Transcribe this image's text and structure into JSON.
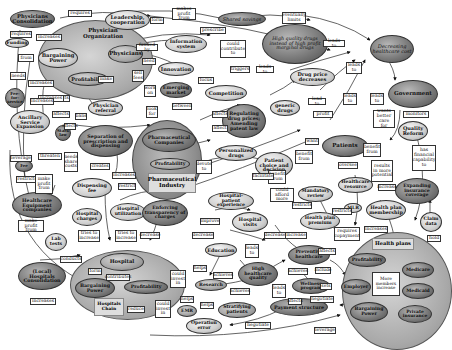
{
  "diagram": {
    "nodes": {
      "physicians_consolidation": "Physicians Consolidation",
      "leadership_cooperation": "Leadership, cooperation",
      "physician_organization": "Physician Organization",
      "bargaining_power_phys": "Bargaining Power",
      "physicians": "Physicians",
      "profitability_phys": "Profitability",
      "funding": "Funding",
      "fee_for_service": "Fee-for-service",
      "physician_referral": "Physician referral",
      "ancillary_service_expansion": "Ancillary Service Expansion",
      "stark_law": "Stark law",
      "shared_savings": "Shared savings",
      "information_system": "Information system",
      "innovation": "Innovation",
      "emerging_market": "Emerging market",
      "competition": "Competition",
      "high_quality_drugs": "High quality drugs instead of high profit marginal drugs",
      "decreasing_healthcare_cost": "Decreasing healthcare cost",
      "drug_price_decreases": "Drug price decreases",
      "generic_drugs": "generic drugs",
      "regulating_drug_prices": "Regulating drug prices; Amending patent law",
      "government": "Government",
      "quality_reform": "Quality Reform",
      "separation_prescription_dispensing": "Separation of prescription and dispensing",
      "pharmaceutical_companies": "Pharmaceutical Companies",
      "profitability_pharma": "Profitability",
      "pharmaceutical_industry": "Pharmaceutical Industry",
      "personalized_drugs": "Personalized drugs",
      "patient_choice": "Patient choice and decision",
      "patients": "Patients",
      "dispensing_fee": "Dispensing fee",
      "fee_icon": "Fee",
      "healthcare_equipment_companies": "Healthcare Equipment companies",
      "hospital_charges": "Hospital charges",
      "hospital_utilization": "Hospital utilization",
      "enforcing_transparency": "Enforcing transparency of charges",
      "hospital_patient_experience": "Hospital-patient experience",
      "hospital_visits": "Hospital visits",
      "mandatory_review": "Mandatory review",
      "healthcare_resource": "Healthcare resource",
      "mlr": "MLR",
      "health_plan_premium": "Health plan premium",
      "health_plan_membership": "Health plan membership",
      "expanding_insurance_coverage": "Expanding insurance coverage",
      "claim_data": "Claim data",
      "lab_tests": "Lab tests",
      "local_hospitals_consolidation": "(Local) Hospitals Consolidation",
      "hospital": "Hospital",
      "bargaining_power_hosp": "Bargaining Power",
      "profitability_hosp": "Profitability",
      "hospitals_chain": "Hospitals Chain",
      "education": "Education",
      "research": "Research",
      "emr": "EMR",
      "stratifying_patients": "Stratifying patients",
      "operation_error": "Operation error",
      "high_healthcare_quality": "High healthcare quality",
      "preventive_healthcare": "Preventive healthcare",
      "wellness_program": "Wellness program",
      "payment_structure": "Payment structure",
      "health_plans": "Health plans",
      "profitability_hp": "Profitability",
      "medicare": "Medicare",
      "employer": "Employer",
      "more_members_increase": "More members increase",
      "medicaid": "Medicaid",
      "bargaining_power_hp": "Bargaining Power",
      "private_insurance": "Private insurance"
    },
    "edge_labels": [
      "requires",
      "form",
      "makes profit from",
      "eventually limits",
      "requires",
      "increases",
      "funded by",
      "from",
      "prescribe",
      "could contribute to",
      "leads to",
      "needs",
      "need",
      "triggers",
      "leads to",
      "leads to",
      "make",
      "increases",
      "sell fees",
      "work on",
      "focus",
      "lead to",
      "leads to",
      "leads to",
      "affects",
      "increases",
      "affects",
      "look for",
      "between",
      "profit",
      "monitors",
      "bans",
      "affects",
      "affect",
      "wants better care for",
      "leverage",
      "threaten",
      "needs share costs",
      "affects",
      "benefit from",
      "want",
      "benefit from",
      "restricts",
      "make profit from",
      "creates",
      "increases",
      "devote to",
      "benefit from",
      "results in more potential",
      "has financial capability to",
      "restrict",
      "facilitate",
      "oversee",
      "could afford more",
      "increase",
      "make profit from",
      "tries to increase",
      "tries to increase",
      "decrease",
      "improve",
      "restricts",
      "restricts",
      "conducts",
      "form",
      "contributes",
      "increases",
      "decrease",
      "decrease",
      "leads to",
      "requires copayment",
      "increases",
      "increase",
      "helps",
      "achieves",
      "affects",
      "include",
      "could invest in",
      "helps",
      "achieves",
      "achieves",
      "sets",
      "could invest in",
      "helps",
      "leads to",
      "affects",
      "negotiate",
      "reduce",
      "negotiate",
      "leverage",
      "hold",
      "increases"
    ]
  }
}
